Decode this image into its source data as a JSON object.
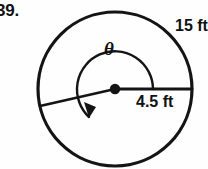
{
  "problem": {
    "number": "39."
  },
  "figure": {
    "shape_name": "circle-with-central-angle",
    "stroke_color": "#141414",
    "background_color": "#fefefe",
    "circle": {
      "center_x": 115,
      "center_y": 89,
      "radius": 77
    },
    "center_point": {
      "name": "center-dot",
      "radius": 5
    },
    "radii": [
      {
        "name": "radius-horizontal",
        "end_x": 192,
        "end_y": 89
      },
      {
        "name": "radius-angled",
        "end_x": 40,
        "end_y": 106
      }
    ],
    "angle_arc": {
      "name": "theta-arc",
      "sweep": "counterclockwise",
      "arrowhead": "end"
    }
  },
  "labels": {
    "arc_length": "15 ft",
    "radius": "4.5 ft",
    "angle": "θ"
  }
}
